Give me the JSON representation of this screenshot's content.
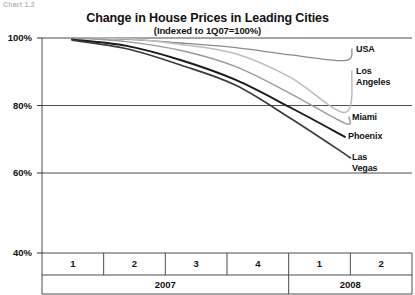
{
  "corner_tag": "Chart 1.2",
  "chart_data": {
    "type": "line",
    "title": "Change in House Prices in Leading Cities",
    "subtitle": "(Indexed to 1Q07=100%)",
    "xlabel": "",
    "ylabel": "",
    "ylim": [
      40,
      102
    ],
    "yticks": [
      100,
      80,
      60,
      40
    ],
    "ytick_labels": [
      "100%",
      "80%",
      "60%",
      "40%"
    ],
    "grid": true,
    "legend_position": "right-inline",
    "x": [
      "1Q07",
      "2Q07",
      "3Q07",
      "4Q07",
      "1Q08",
      "2Q08"
    ],
    "categories": [
      "1",
      "2",
      "3",
      "4",
      "1",
      "2"
    ],
    "group_labels": [
      "2007",
      "2008"
    ],
    "group_spans": [
      4,
      2
    ],
    "series": [
      {
        "name": "USA",
        "label": "USA",
        "color": "#8a8a8a",
        "width": 1.3,
        "values": [
          100.0,
          99.6,
          98.6,
          97.3,
          95.3,
          93.7
        ]
      },
      {
        "name": "Los Angeles",
        "label": "Los\nAngeles",
        "color": "#bdbdbd",
        "width": 1.5,
        "values": [
          100.0,
          99.8,
          98.2,
          95.6,
          89.0,
          79.2
        ]
      },
      {
        "name": "Miami",
        "label": "Miami",
        "color": "#9a9a9a",
        "width": 1.4,
        "values": [
          100.0,
          99.0,
          96.5,
          92.0,
          84.5,
          76.2
        ]
      },
      {
        "name": "Phoenix",
        "label": "Phoenix",
        "color": "#1a1a1a",
        "width": 1.9,
        "values": [
          99.6,
          97.8,
          93.8,
          88.3,
          80.6,
          72.4
        ]
      },
      {
        "name": "Las Vegas",
        "label": "Las\nVegas",
        "color": "#3a3a3a",
        "width": 1.6,
        "values": [
          99.4,
          97.0,
          92.4,
          86.8,
          77.6,
          67.6
        ]
      }
    ]
  },
  "label_positions": {
    "USA": {
      "x": 356,
      "y": 44
    },
    "Los Angeles": {
      "x": 356,
      "y": 66
    },
    "Miami": {
      "x": 352,
      "y": 112
    },
    "Phoenix": {
      "x": 348,
      "y": 131
    },
    "Las Vegas": {
      "x": 352,
      "y": 152
    }
  }
}
